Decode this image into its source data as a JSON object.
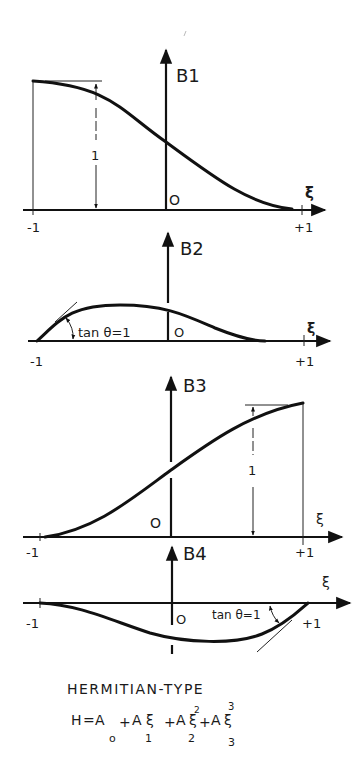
{
  "title": "HERMITIAN-TYPE",
  "formula": {
    "lhs": "H",
    "equals": "=",
    "terms": [
      {
        "coef": "A",
        "sub": "o",
        "var": "",
        "power": ""
      },
      {
        "coef": "A",
        "sub": "1",
        "var": "ξ",
        "power": ""
      },
      {
        "coef": "A",
        "sub": "2",
        "var": "ξ",
        "power": "2"
      },
      {
        "coef": "A",
        "sub": "3",
        "var": "ξ",
        "power": "3"
      }
    ],
    "plus": "+"
  },
  "panels": [
    {
      "id": "B1",
      "label": "B1",
      "origin": "O",
      "xvar": "ξ",
      "xmin": "-1",
      "xmax": "+1",
      "dim_label": "1",
      "annotation": ""
    },
    {
      "id": "B2",
      "label": "B2",
      "origin": "O",
      "xvar": "ξ",
      "xmin": "-1",
      "xmax": "+1",
      "dim_label": "",
      "annotation": "tan θ=1"
    },
    {
      "id": "B3",
      "label": "B3",
      "origin": "O",
      "xvar": "ξ",
      "xmin": "-1",
      "xmax": "+1",
      "dim_label": "1",
      "annotation": ""
    },
    {
      "id": "B4",
      "label": "B4",
      "origin": "O",
      "xvar": "ξ",
      "xmin": "-1",
      "xmax": "+1",
      "dim_label": "",
      "annotation": "tan θ=1"
    }
  ],
  "colors": {
    "ink": "#111111",
    "paper": "#ffffff"
  }
}
